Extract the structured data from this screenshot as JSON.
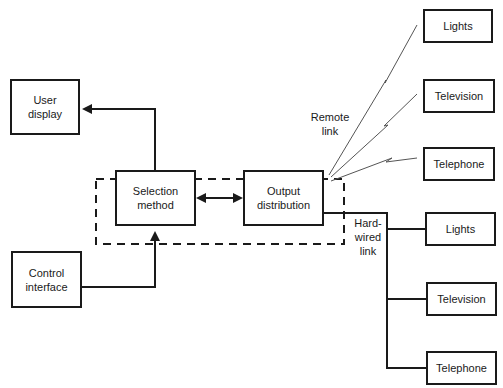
{
  "diagram": {
    "nodes": {
      "user_display": "User\ndisplay",
      "control_interface": "Control\ninterface",
      "selection_method": "Selection\nmethod",
      "output_distribution": "Output\ndistribution",
      "remote_lights": "Lights",
      "remote_television": "Television",
      "remote_telephone": "Telephone",
      "wired_lights": "Lights",
      "wired_television": "Television",
      "wired_telephone": "Telephone"
    },
    "labels": {
      "remote_link": "Remote\nlink",
      "hard_wired_link": "Hard-\nwired\nlink"
    },
    "edges": [
      {
        "from": "selection_method",
        "to": "user_display",
        "type": "arrow"
      },
      {
        "from": "control_interface",
        "to": "selection_method",
        "type": "arrow"
      },
      {
        "from": "selection_method",
        "to": "output_distribution",
        "type": "bidirectional"
      },
      {
        "from": "output_distribution",
        "to": "remote_lights",
        "type": "wireless"
      },
      {
        "from": "output_distribution",
        "to": "remote_television",
        "type": "wireless"
      },
      {
        "from": "output_distribution",
        "to": "remote_telephone",
        "type": "wireless"
      },
      {
        "from": "output_distribution",
        "to": "wired_lights",
        "type": "wire"
      },
      {
        "from": "output_distribution",
        "to": "wired_television",
        "type": "wire"
      },
      {
        "from": "output_distribution",
        "to": "wired_telephone",
        "type": "wire"
      }
    ],
    "group": "dashed boundary around selection method and output distribution"
  }
}
